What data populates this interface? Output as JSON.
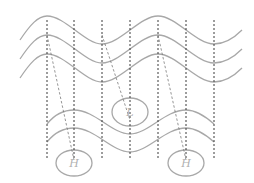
{
  "diagram": {
    "colors": {
      "background": "#ffffff",
      "wave_stroke": "#a8a8a8",
      "vertical_line": "#3a3a3a",
      "slant_line": "#7a7a7a",
      "label": "#b0b0b0"
    },
    "top_waves": [
      {
        "id": "top-wave-1",
        "path": "M20,40 C30,25 38,16 47,16 C65,16 85,44 102,44 C120,44 140,16 158,16 C176,16 196,44 214,44 C226,44 236,36 242,30"
      },
      {
        "id": "top-wave-2",
        "path": "M20,59 C30,44 38,35 47,35 C65,35 85,63 102,63 C120,63 140,35 158,35 C176,35 196,63 214,63 C226,63 236,55 242,49"
      },
      {
        "id": "top-wave-3",
        "path": "M20,78 C30,63 38,54 47,54 C65,54 85,82 102,82 C120,82 140,54 158,54 C176,54 196,82 214,82 C226,82 236,74 242,68"
      }
    ],
    "bottom_waves": [
      {
        "id": "bottom-wave-1",
        "path": "M47,124 C55,114 64,110 74,110 C95,110 112,134 130,134 C148,134 165,110 186,110 C196,110 205,116 214,124"
      },
      {
        "id": "bottom-wave-2",
        "path": "M47,142 C55,132 64,128 74,128 C95,128 112,152 130,152 C148,152 165,128 186,128 C196,128 205,134 214,142"
      }
    ],
    "vertical_lines_x": [
      47,
      74,
      102,
      130,
      158,
      186,
      214
    ],
    "vertical_line_y": [
      20,
      160
    ],
    "slant_lines": [
      {
        "x1": 47,
        "y1": 35,
        "x2": 74,
        "y2": 160
      },
      {
        "x1": 102,
        "y1": 35,
        "x2": 130,
        "y2": 120
      },
      {
        "x1": 158,
        "y1": 35,
        "x2": 186,
        "y2": 160
      }
    ],
    "ellipses": [
      {
        "id": "center-ellipse",
        "cx": 130,
        "cy": 112,
        "rx": 18,
        "ry": 14,
        "label": "L"
      },
      {
        "id": "left-ellipse",
        "cx": 74,
        "cy": 163,
        "rx": 18,
        "ry": 13,
        "label": "H"
      },
      {
        "id": "right-ellipse",
        "cx": 186,
        "cy": 163,
        "rx": 18,
        "ry": 13,
        "label": "H"
      }
    ]
  }
}
